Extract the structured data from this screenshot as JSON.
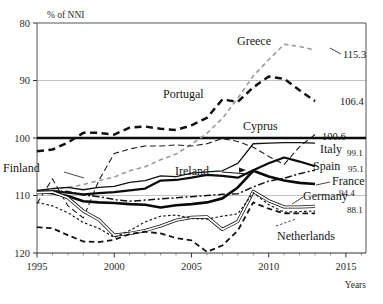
{
  "chart_data": {
    "type": "line",
    "title": "",
    "ylabel": "% of NNI",
    "xlabel": "Years",
    "xlim": [
      1995,
      2016.3
    ],
    "ylim": [
      80,
      120
    ],
    "yticks": [
      80,
      90,
      100,
      110,
      120
    ],
    "xticks": [
      1995,
      2000,
      2005,
      2010,
      2015
    ],
    "grid": "horizontal gridlines at 90 and 110; bold reference line at 100",
    "legend_position": "inline labels on curves and at right edge",
    "x": [
      1995,
      1996,
      1997,
      1998,
      1999,
      2000,
      2001,
      2002,
      2003,
      2004,
      2005,
      2006,
      2007,
      2008,
      2009,
      2010,
      2011,
      2012,
      2013
    ],
    "series": [
      {
        "name": "Greece",
        "style": "light-gray slanted dashes",
        "end_value": 115.3,
        "values": [
          90.6,
          91.2,
          91.4,
          91.9,
          92.6,
          93.2,
          94.3,
          95.0,
          96.2,
          97.2,
          98.9,
          100.8,
          103.4,
          106.9,
          110.8,
          113.6,
          116.3,
          115.9,
          115.3
        ]
      },
      {
        "name": "Portugal",
        "style": "bold black long dashes",
        "end_value": 106.4,
        "values": [
          97.7,
          98.0,
          99.2,
          100.9,
          100.9,
          100.6,
          101.8,
          102.0,
          101.6,
          101.4,
          102.2,
          103.5,
          106.7,
          106.3,
          108.8,
          110.7,
          110.3,
          108.3,
          106.4
        ]
      },
      {
        "name": "Cyprus",
        "style": "thin dark dashes",
        "end_value": 100.6,
        "values": [
          88.6,
          92.9,
          88.2,
          86.1,
          92.6,
          97.3,
          98.1,
          98.6,
          98.6,
          98.8,
          98.6,
          99.0,
          99.9,
          99.4,
          98.4,
          96.8,
          95.4,
          98.5,
          100.6
        ]
      },
      {
        "name": "Italy",
        "style": "thin solid black",
        "end_value": 99.1,
        "values": [
          90.9,
          91.2,
          91.4,
          91.0,
          91.4,
          91.6,
          92.3,
          92.6,
          93.4,
          93.3,
          93.9,
          94.1,
          94.3,
          95.6,
          99.0,
          99.1,
          99.2,
          99.2,
          99.1
        ]
      },
      {
        "name": "Spain",
        "style": "medium solid black",
        "end_value": 95.1,
        "values": [
          90.6,
          90.7,
          90.5,
          90.2,
          90.4,
          90.6,
          90.9,
          91.2,
          92.6,
          92.7,
          93.1,
          93.6,
          93.4,
          93.1,
          94.4,
          95.6,
          96.6,
          95.9,
          95.1
        ]
      },
      {
        "name": "France",
        "style": "dash-dot black",
        "end_value": 94.4,
        "values": [
          90.8,
          90.8,
          90.7,
          90.1,
          89.8,
          89.3,
          89.0,
          89.2,
          89.4,
          89.6,
          89.8,
          90.0,
          90.2,
          90.3,
          91.5,
          92.5,
          93.0,
          93.8,
          94.4
        ]
      },
      {
        "name": "Ireland",
        "style": "thick solid black",
        "end_value": null,
        "values": [
          90.6,
          90.4,
          89.9,
          89.0,
          88.8,
          88.7,
          88.5,
          88.4,
          87.9,
          88.3,
          88.5,
          88.8,
          89.5,
          91.4,
          94.3,
          93.3,
          92.6,
          92.2,
          92.0
        ]
      },
      {
        "name": "Germany",
        "style": "double thin line (gray core)",
        "end_value": 88.1,
        "values": [
          90.5,
          90.6,
          89.6,
          87.3,
          85.8,
          83.1,
          83.4,
          83.9,
          84.7,
          85.7,
          86.2,
          86.3,
          84.1,
          85.5,
          90.7,
          89.1,
          88.0,
          88.0,
          88.1
        ]
      },
      {
        "name": "Netherlands",
        "style": "short fine dashes",
        "end_value": null,
        "values": [
          88.8,
          88.2,
          87.0,
          85.3,
          84.3,
          82.7,
          83.9,
          85.4,
          86.4,
          86.6,
          86.0,
          85.9,
          86.4,
          86.8,
          90.5,
          88.4,
          87.1,
          87.2,
          87.3
        ]
      },
      {
        "name": "Finland",
        "style": "medium black dashes",
        "end_value": null,
        "values": [
          84.5,
          84.3,
          83.1,
          82.0,
          81.9,
          82.3,
          83.3,
          83.7,
          83.4,
          82.6,
          82.2,
          80.2,
          81.3,
          83.9,
          88.8,
          87.7,
          86.9,
          86.9,
          86.9
        ]
      }
    ]
  },
  "axis": {
    "y_unit": "% of NNI",
    "y_ticks": [
      "120",
      "110",
      "100",
      "90",
      "80"
    ],
    "x_ticks": [
      "1995",
      "2000",
      "2005",
      "2010",
      "2015"
    ],
    "x_title": "Years"
  },
  "annotations": {
    "greece": "Greece",
    "portugal": "Portugal",
    "cyprus": "Cyprus",
    "ireland": "Ireland",
    "finland": "Finland",
    "germany": "Germany",
    "netherlands": "Netherlands",
    "italy": "Italy",
    "spain": "Spain",
    "france": "France",
    "v_greece": "115.3",
    "v_portugal": "106.4",
    "v_cyprus": "100.6",
    "v_italy": "99.1",
    "v_spain": "95.1",
    "v_france": "94.4",
    "v_germany": "88.1"
  },
  "colors": {
    "ink": "#161616",
    "axis": "#2b2b2b",
    "grid": "#b9b9b9",
    "light_series": "#9a9a9a",
    "background": "#ffffff"
  }
}
